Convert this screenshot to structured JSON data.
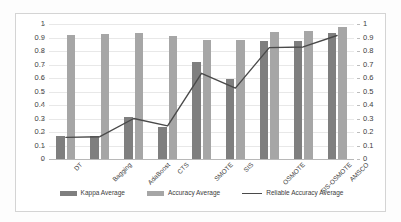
{
  "chart_data": {
    "type": "bar",
    "title": "",
    "subtitle": "",
    "xlabel": "",
    "ylabel": "",
    "ylim": [
      0,
      1
    ],
    "y2lim": [
      0,
      1
    ],
    "grid": true,
    "legend_position": "bottom",
    "categories": [
      "DT",
      "Bagging",
      "AdaBoost",
      "CTS",
      "SMOTE",
      "SIS",
      "OSMOTE",
      "SIS-OSMOTE",
      "AMSCO"
    ],
    "tick_labels": [
      "1",
      "0.9",
      "0.8",
      "0.7",
      "0.6",
      "0.5",
      "0.4",
      "0.3",
      "0.2",
      "0.1",
      "0"
    ],
    "tick_values": [
      1,
      0.9,
      0.8,
      0.7,
      0.6,
      0.5,
      0.4,
      0.3,
      0.2,
      0.1,
      0
    ],
    "series": [
      {
        "name": "Kappa Average",
        "type": "bar",
        "color": "#7f7f7f",
        "axis": "left",
        "values": [
          0.17,
          0.17,
          0.31,
          0.24,
          0.72,
          0.59,
          0.875,
          0.875,
          0.93
        ]
      },
      {
        "name": "Accuracy Average",
        "type": "bar",
        "color": "#a6a6a6",
        "axis": "left",
        "values": [
          0.92,
          0.925,
          0.93,
          0.91,
          0.885,
          0.885,
          0.94,
          0.945,
          0.975
        ]
      },
      {
        "name": "Reliable Accuracy Average",
        "type": "line",
        "color": "#4a4a4a",
        "axis": "right",
        "values": [
          0.16,
          0.165,
          0.3,
          0.245,
          0.635,
          0.525,
          0.825,
          0.83,
          0.915
        ]
      }
    ]
  },
  "legend": {
    "items": [
      {
        "label": "Kappa Average",
        "marker": "bar-swatch-dark"
      },
      {
        "label": "Accuracy Average",
        "marker": "bar-swatch-light"
      },
      {
        "label": "Reliable Accuracy Average",
        "marker": "line-swatch"
      }
    ]
  },
  "colors": {
    "kappa_bar": "#7f7f7f",
    "accuracy_bar": "#a6a6a6",
    "line": "#4a4a4a",
    "gridline": "#e8e8e8",
    "frame": "#d4d4d4",
    "text": "#3c3c3c"
  }
}
